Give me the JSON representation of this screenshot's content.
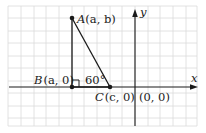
{
  "diagram": {
    "type": "coordinate-geometry",
    "grid": {
      "x0": 8,
      "x1": 197,
      "y0": 6,
      "y1": 126,
      "spacing": 12.6,
      "color": "#d9d9d9"
    },
    "axes": {
      "x_label": "x",
      "y_label": "y",
      "origin_label": "(0, 0)",
      "origin_px": [
        135,
        87
      ]
    },
    "points": [
      {
        "id": "A",
        "name": "A",
        "coords": "(a, b)",
        "px": [
          72,
          18
        ]
      },
      {
        "id": "B",
        "name": "B",
        "coords": "(a, 0)",
        "px": [
          72,
          87
        ]
      },
      {
        "id": "C",
        "name": "C",
        "coords": "(c, 0)",
        "px": [
          110,
          87
        ]
      }
    ],
    "triangle": {
      "vertices": [
        "A",
        "B",
        "C"
      ],
      "right_angle_at": "B"
    },
    "angle_label": {
      "at": "C",
      "text": "60°"
    }
  },
  "labels": {
    "A": "A",
    "A_coords": "(a, b)",
    "B": "B",
    "B_coords": "(a, 0)",
    "C": "C",
    "C_coords": "(c, 0)",
    "origin": "(0, 0)",
    "angle": "60°",
    "x_axis": "x",
    "y_axis": "y"
  }
}
